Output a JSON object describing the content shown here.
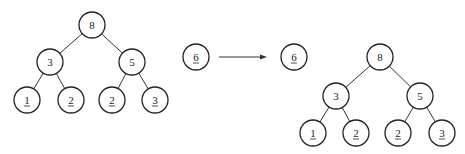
{
  "diagram": {
    "left_tree": {
      "nodes": [
        {
          "id": "a",
          "label": "8",
          "x": 92,
          "y": 25,
          "underlined": false
        },
        {
          "id": "b",
          "label": "3",
          "x": 50,
          "y": 62,
          "underlined": false
        },
        {
          "id": "c",
          "label": "5",
          "x": 132,
          "y": 62,
          "underlined": false
        },
        {
          "id": "d",
          "label": "1",
          "x": 27,
          "y": 100,
          "underlined": true
        },
        {
          "id": "e",
          "label": "2",
          "x": 71,
          "y": 100,
          "underlined": true
        },
        {
          "id": "f",
          "label": "2",
          "x": 112,
          "y": 100,
          "underlined": true
        },
        {
          "id": "g",
          "label": "3",
          "x": 155,
          "y": 100,
          "underlined": true
        }
      ],
      "edges": [
        [
          "a",
          "b"
        ],
        [
          "a",
          "c"
        ],
        [
          "b",
          "d"
        ],
        [
          "b",
          "e"
        ],
        [
          "c",
          "f"
        ],
        [
          "c",
          "g"
        ]
      ]
    },
    "input_node": {
      "label": "6",
      "x": 196,
      "y": 57,
      "underlined": true
    },
    "arrow": {
      "x1": 219,
      "y1": 57,
      "x2": 267,
      "y2": 57
    },
    "output_node": {
      "label": "6",
      "x": 294,
      "y": 57,
      "underlined": true
    },
    "right_tree": {
      "nodes": [
        {
          "id": "a",
          "label": "8",
          "x": 380,
          "y": 57,
          "underlined": false
        },
        {
          "id": "b",
          "label": "3",
          "x": 336,
          "y": 96,
          "underlined": false
        },
        {
          "id": "c",
          "label": "5",
          "x": 420,
          "y": 96,
          "underlined": false
        },
        {
          "id": "d",
          "label": "1",
          "x": 313,
          "y": 133,
          "underlined": true
        },
        {
          "id": "e",
          "label": "2",
          "x": 356,
          "y": 133,
          "underlined": true
        },
        {
          "id": "f",
          "label": "2",
          "x": 398,
          "y": 133,
          "underlined": true
        },
        {
          "id": "g",
          "label": "3",
          "x": 442,
          "y": 133,
          "underlined": true
        }
      ],
      "edges": [
        [
          "a",
          "b"
        ],
        [
          "a",
          "c"
        ],
        [
          "b",
          "d"
        ],
        [
          "b",
          "e"
        ],
        [
          "c",
          "f"
        ],
        [
          "c",
          "g"
        ]
      ]
    },
    "node_radius": 13,
    "colors": {
      "stroke": "#222222",
      "background": "#ffffff"
    }
  }
}
